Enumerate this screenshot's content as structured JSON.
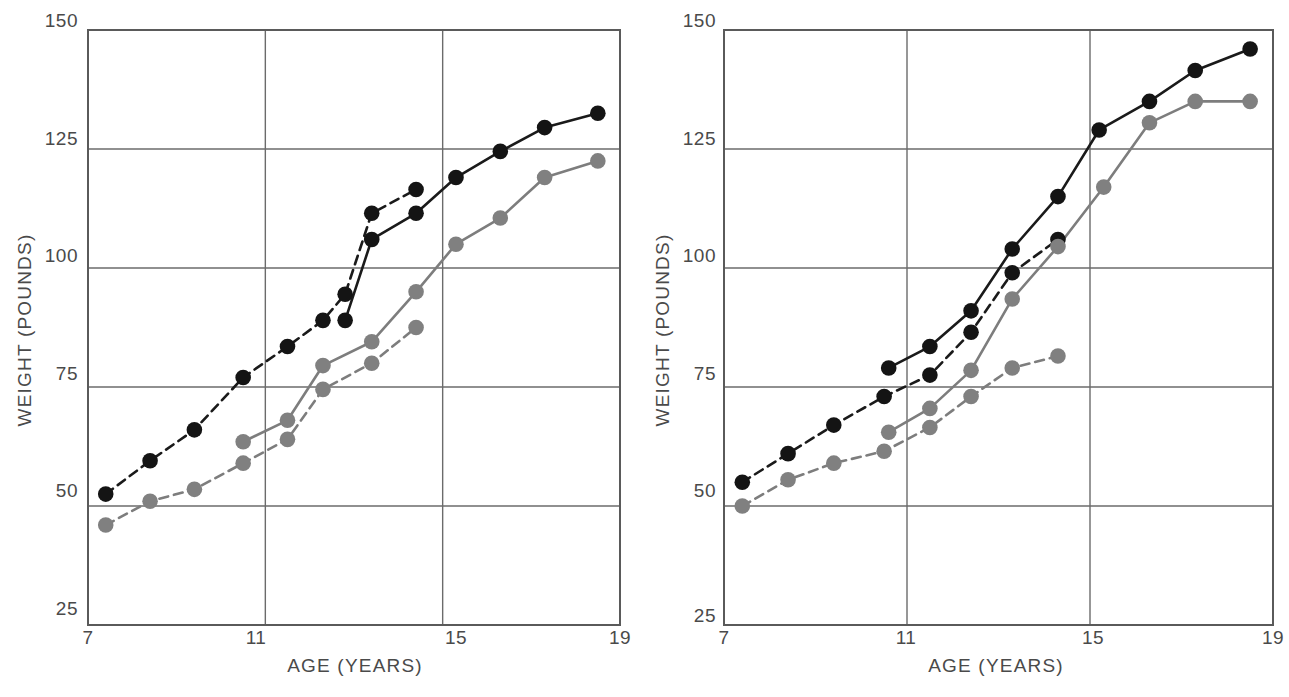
{
  "figure": {
    "panels": [
      "left",
      "right"
    ],
    "width": 1289,
    "height": 697
  },
  "axes": {
    "xlabel": "AGE (YEARS)",
    "ylabel": "WEIGHT (POUNDS)",
    "xticks": [
      "7",
      "11",
      "15",
      "19"
    ],
    "yticks": [
      "150",
      "125",
      "100",
      "75",
      "50",
      "25"
    ],
    "xlim": [
      7,
      19
    ],
    "ylim": [
      25,
      150
    ]
  },
  "colors": {
    "dark": "#141414",
    "gray": "#808080",
    "grid": "#6b6b6b",
    "frame": "#5a5a5a",
    "text": "#4a4a4a",
    "background": "#ffffff"
  },
  "chart_data": [
    {
      "type": "line",
      "panel": "left",
      "title": "",
      "xlabel": "AGE (YEARS)",
      "ylabel": "WEIGHT (POUNDS)",
      "xlim": [
        7,
        19
      ],
      "ylim": [
        25,
        150
      ],
      "xticks": [
        7,
        11,
        15,
        19
      ],
      "yticks": [
        25,
        50,
        75,
        100,
        125,
        150
      ],
      "grid": true,
      "legend": "none",
      "series": [
        {
          "name": "dark-dashed",
          "color": "#141414",
          "linestyle": "dashed",
          "marker": "circle",
          "x": [
            7.4,
            8.4,
            9.4,
            10.5,
            11.5,
            12.3,
            12.8,
            13.4,
            14.4
          ],
          "y": [
            52.5,
            59.5,
            66,
            77,
            83.5,
            89,
            94.5,
            111.5,
            116.5
          ]
        },
        {
          "name": "dark-solid",
          "color": "#141414",
          "linestyle": "solid",
          "marker": "circle",
          "x": [
            12.8,
            13.4,
            14.4,
            15.3,
            16.3,
            17.3,
            18.5
          ],
          "y": [
            89,
            106,
            111.5,
            119,
            124.5,
            129.5,
            132.5
          ]
        },
        {
          "name": "gray-dashed",
          "color": "#808080",
          "linestyle": "dashed",
          "marker": "circle",
          "x": [
            7.4,
            8.4,
            9.4,
            10.5,
            11.5,
            12.3,
            13.4,
            14.4
          ],
          "y": [
            46,
            51,
            53.5,
            59,
            64,
            74.5,
            80,
            87.5
          ]
        },
        {
          "name": "gray-solid",
          "color": "#808080",
          "linestyle": "solid",
          "marker": "circle",
          "x": [
            10.5,
            11.5,
            12.3,
            13.4,
            14.4,
            15.3,
            16.3,
            17.3,
            18.5
          ],
          "y": [
            63.5,
            68,
            79.5,
            84.5,
            95,
            105,
            110.5,
            119,
            122.5
          ]
        }
      ]
    },
    {
      "type": "line",
      "panel": "right",
      "title": "",
      "xlabel": "AGE (YEARS)",
      "ylabel": "WEIGHT (POUNDS)",
      "xlim": [
        7,
        19
      ],
      "ylim": [
        25,
        150
      ],
      "xticks": [
        7,
        11,
        15,
        19
      ],
      "yticks": [
        25,
        50,
        75,
        100,
        125,
        150
      ],
      "grid": true,
      "legend": "none",
      "series": [
        {
          "name": "dark-dashed",
          "color": "#141414",
          "linestyle": "dashed",
          "marker": "circle",
          "x": [
            7.4,
            8.4,
            9.4,
            10.5,
            11.5,
            12.4,
            13.3,
            14.3
          ],
          "y": [
            55,
            61,
            67,
            73,
            77.5,
            86.5,
            99,
            106
          ]
        },
        {
          "name": "dark-solid",
          "color": "#141414",
          "linestyle": "solid",
          "marker": "circle",
          "x": [
            10.6,
            11.5,
            12.4,
            13.3,
            14.3,
            15.2,
            16.3,
            17.3,
            18.5
          ],
          "y": [
            79,
            83.5,
            91,
            104,
            115,
            129,
            135,
            141.5,
            146
          ]
        },
        {
          "name": "gray-dashed",
          "color": "#808080",
          "linestyle": "dashed",
          "marker": "circle",
          "x": [
            7.4,
            8.4,
            9.4,
            10.5,
            11.5,
            12.4,
            13.3,
            14.3
          ],
          "y": [
            50,
            55.5,
            59,
            61.5,
            66.5,
            73,
            79,
            81.5
          ]
        },
        {
          "name": "gray-solid",
          "color": "#808080",
          "linestyle": "solid",
          "marker": "circle",
          "x": [
            10.6,
            11.5,
            12.4,
            13.3,
            14.3,
            15.3,
            16.3,
            17.3,
            18.5
          ],
          "y": [
            65.5,
            70.5,
            78.5,
            93.5,
            104.5,
            117,
            130.5,
            135,
            135
          ]
        }
      ]
    }
  ]
}
